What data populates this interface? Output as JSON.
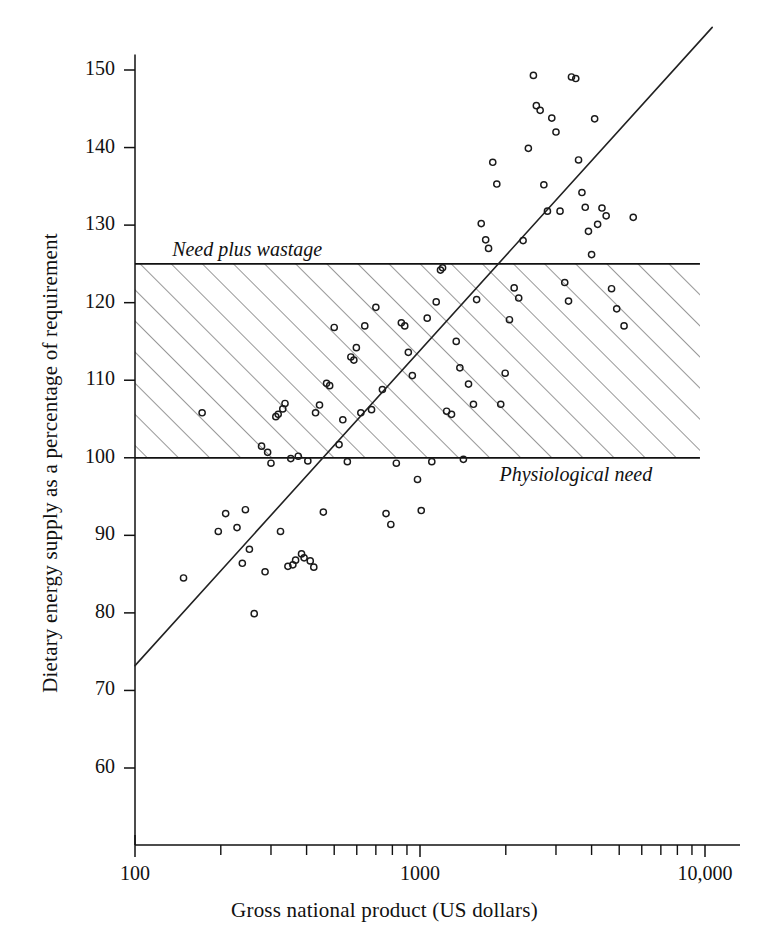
{
  "chart_data": {
    "type": "scatter",
    "title": "",
    "xlabel": "Gross national product (US dollars)",
    "ylabel": "Dietary energy supply as a percentage of requirement",
    "xscale": "log",
    "yscale": "linear",
    "xlim": [
      100,
      10000
    ],
    "ylim": [
      55,
      152
    ],
    "grid": false,
    "legend": "none",
    "xticks_major": [
      {
        "value": 100,
        "label": "100"
      },
      {
        "value": 1000,
        "label": "1000"
      },
      {
        "value": 10000,
        "label": "10,000"
      }
    ],
    "xticks_minor": [
      200,
      300,
      400,
      500,
      600,
      700,
      800,
      900,
      2000,
      3000,
      4000,
      5000,
      6000,
      7000,
      8000,
      9000
    ],
    "yticks": [
      {
        "value": 150,
        "label": "150"
      },
      {
        "value": 140,
        "label": "140"
      },
      {
        "value": 130,
        "label": "130"
      },
      {
        "value": 120,
        "label": "120"
      },
      {
        "value": 110,
        "label": "110"
      },
      {
        "value": 100,
        "label": "100"
      },
      {
        "value": 90,
        "label": "90"
      },
      {
        "value": 80,
        "label": "80"
      },
      {
        "value": 70,
        "label": "70"
      },
      {
        "value": 60,
        "label": "60"
      }
    ],
    "annotations": [
      {
        "name": "need-plus-wastage",
        "text": "Need plus wastage",
        "y": 126.5,
        "x": 135,
        "style": "italic"
      },
      {
        "name": "physiological-need",
        "text": "Physiological need",
        "y": 97.5,
        "x": 1900,
        "style": "italic"
      }
    ],
    "reference_bands": [
      {
        "name": "adequacy-band",
        "y_lower": 100,
        "y_upper": 125,
        "lower_label": "Physiological need",
        "upper_label": "Need plus wastage",
        "fill": "diagonal-hatch",
        "hatch_color": "#555555",
        "x_start": 100,
        "x_end": 9600
      }
    ],
    "trend_lines": [
      {
        "name": "regression-line",
        "points": [
          [
            100,
            73.2
          ],
          [
            10600,
            155.5
          ]
        ],
        "color": "#222222",
        "width": 1.6
      }
    ],
    "points": [
      [
        148,
        84.5
      ],
      [
        172,
        105.8
      ],
      [
        196,
        90.5
      ],
      [
        208,
        92.8
      ],
      [
        228,
        91.0
      ],
      [
        238,
        86.4
      ],
      [
        244,
        93.3
      ],
      [
        252,
        88.2
      ],
      [
        262,
        79.9
      ],
      [
        278,
        101.5
      ],
      [
        286,
        85.3
      ],
      [
        292,
        100.7
      ],
      [
        300,
        99.3
      ],
      [
        312,
        105.3
      ],
      [
        318,
        105.6
      ],
      [
        324,
        90.5
      ],
      [
        330,
        106.3
      ],
      [
        336,
        107.0
      ],
      [
        344,
        86.0
      ],
      [
        352,
        99.9
      ],
      [
        358,
        86.2
      ],
      [
        366,
        86.8
      ],
      [
        374,
        100.2
      ],
      [
        384,
        87.6
      ],
      [
        392,
        87.1
      ],
      [
        404,
        99.6
      ],
      [
        412,
        86.7
      ],
      [
        424,
        85.9
      ],
      [
        430,
        105.8
      ],
      [
        444,
        106.8
      ],
      [
        458,
        93.0
      ],
      [
        470,
        109.6
      ],
      [
        482,
        109.3
      ],
      [
        500,
        116.8
      ],
      [
        520,
        101.7
      ],
      [
        536,
        104.9
      ],
      [
        556,
        99.5
      ],
      [
        572,
        113.0
      ],
      [
        586,
        112.6
      ],
      [
        598,
        114.2
      ],
      [
        620,
        105.8
      ],
      [
        640,
        117.0
      ],
      [
        676,
        106.2
      ],
      [
        700,
        119.4
      ],
      [
        738,
        108.8
      ],
      [
        760,
        92.8
      ],
      [
        790,
        91.4
      ],
      [
        826,
        99.3
      ],
      [
        860,
        117.4
      ],
      [
        884,
        117.0
      ],
      [
        910,
        113.6
      ],
      [
        940,
        110.6
      ],
      [
        980,
        97.2
      ],
      [
        1010,
        93.2
      ],
      [
        1060,
        118.0
      ],
      [
        1100,
        99.5
      ],
      [
        1140,
        120.1
      ],
      [
        1180,
        124.2
      ],
      [
        1200,
        124.5
      ],
      [
        1240,
        106.0
      ],
      [
        1290,
        105.6
      ],
      [
        1340,
        115.0
      ],
      [
        1380,
        111.6
      ],
      [
        1420,
        99.8
      ],
      [
        1480,
        109.5
      ],
      [
        1540,
        106.9
      ],
      [
        1580,
        120.4
      ],
      [
        1640,
        130.2
      ],
      [
        1700,
        128.1
      ],
      [
        1740,
        127.0
      ],
      [
        1800,
        138.1
      ],
      [
        1860,
        135.3
      ],
      [
        1920,
        106.9
      ],
      [
        1990,
        110.9
      ],
      [
        2060,
        117.8
      ],
      [
        2140,
        121.9
      ],
      [
        2220,
        120.6
      ],
      [
        2300,
        128.0
      ],
      [
        2400,
        139.9
      ],
      [
        2500,
        149.3
      ],
      [
        2560,
        145.4
      ],
      [
        2640,
        144.8
      ],
      [
        2720,
        135.2
      ],
      [
        2800,
        131.8
      ],
      [
        2900,
        143.8
      ],
      [
        3000,
        142.0
      ],
      [
        3100,
        131.8
      ],
      [
        3220,
        122.6
      ],
      [
        3320,
        120.2
      ],
      [
        3400,
        149.1
      ],
      [
        3520,
        148.9
      ],
      [
        3600,
        138.4
      ],
      [
        3700,
        134.2
      ],
      [
        3800,
        132.3
      ],
      [
        3900,
        129.2
      ],
      [
        4000,
        126.2
      ],
      [
        4100,
        143.7
      ],
      [
        4200,
        130.1
      ],
      [
        4350,
        132.2
      ],
      [
        4500,
        131.2
      ],
      [
        4700,
        121.8
      ],
      [
        4900,
        119.2
      ],
      [
        5200,
        117.0
      ],
      [
        5600,
        131.0
      ]
    ]
  },
  "axes": {
    "x_title": "Gross national product (US dollars)",
    "y_title": "Dietary energy supply as a percentage of requirement"
  }
}
